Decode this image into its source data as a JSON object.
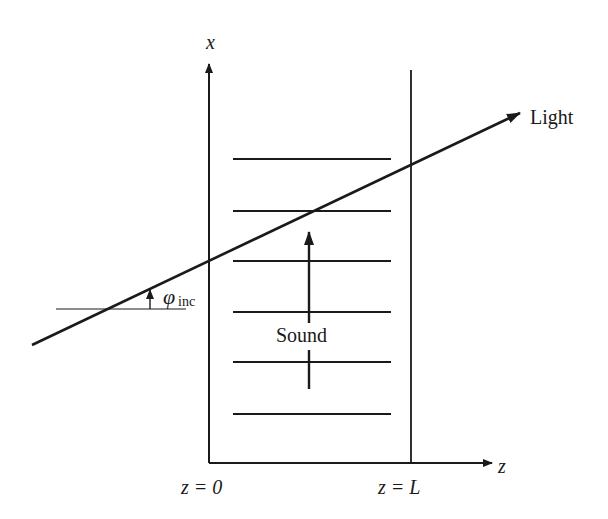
{
  "diagram": {
    "labels": {
      "x_axis": "x",
      "z_axis": "z",
      "z_zero": "z = 0",
      "z_L": "z = L",
      "light": "Light",
      "sound": "Sound",
      "phi_symbol": "φ",
      "phi_subscript": "inc"
    },
    "colors": {
      "stroke": "#1a1a1a",
      "background": "#ffffff"
    },
    "geometry": {
      "left_boundary_x": 209,
      "right_boundary_x": 411,
      "axis_y": 463,
      "x_axis_top": 62,
      "right_boundary_top": 70,
      "wavefront_x1": 233,
      "wavefront_x2": 391,
      "wavefront_ys": [
        159,
        211,
        261,
        312,
        362,
        414
      ],
      "light_ray": {
        "x1": 32,
        "y1": 345,
        "x2": 520,
        "y2": 113
      },
      "reference_line": {
        "x1": 56,
        "x2": 186,
        "y": 309
      },
      "sound_arrow_x": 309
    }
  }
}
